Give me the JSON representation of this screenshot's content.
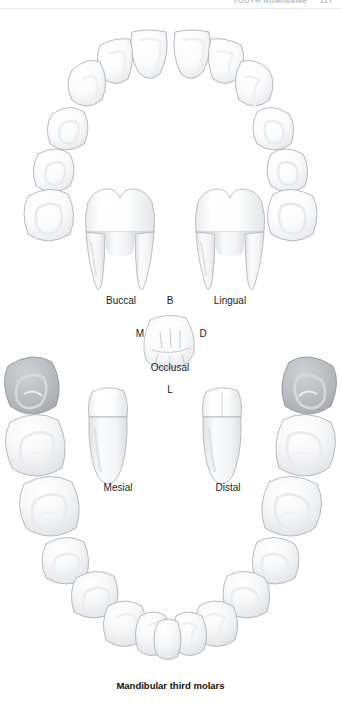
{
  "runhead": {
    "title": "TOOTH NUM/NAME",
    "page": "117"
  },
  "figure": {
    "caption": "Mandibular third molars",
    "tooth_name": "Mandibular third molars",
    "arch": "mandibular",
    "view": "occlusal arch with isolated tooth views"
  },
  "views": {
    "buccal": "Buccal",
    "lingual": "Lingual",
    "occlusal": "Occlusal",
    "mesial": "Mesial",
    "distal": "Distal"
  },
  "orientation_marks": {
    "buccal_initial": "B",
    "lingual_initial": "L",
    "mesial_initial": "M",
    "distal_initial": "D"
  },
  "colors": {
    "tooth_fill": "#fbfbfc",
    "tooth_outline": "#9aa0a8",
    "tooth_shadow": "#e3e5e8",
    "highlight_fill": "#b4b7ba",
    "highlight_outline": "#8f949a",
    "label_text": "#1d1d1d",
    "runhead_text": "#b9bcc2",
    "background": "#ffffff"
  },
  "highlighted_teeth": [
    {
      "position": "left-third-molar",
      "label": "Mandibular third molar (left)"
    },
    {
      "position": "right-third-molar",
      "label": "Mandibular third molar (right)"
    }
  ]
}
